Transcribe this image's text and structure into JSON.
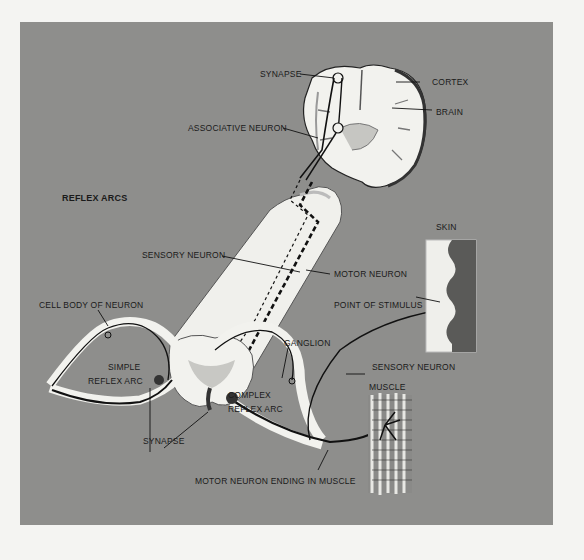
{
  "title": "REFLEX ARCS",
  "labels": {
    "synapse_top": "SYNAPSE",
    "cortex": "CORTEX",
    "brain": "BRAIN",
    "associative_neuron": "ASSOCIATIVE NEURON",
    "sensory_neuron_cord": "SENSORY NEURON",
    "motor_neuron": "MOTOR NEURON",
    "skin": "SKIN",
    "point_of_stimulus": "POINT OF STIMULUS",
    "cell_body_of_neuron": "CELL BODY OF NEURON",
    "ganglion": "GANGLION",
    "sensory_neuron_skin": "SENSORY NEURON",
    "simple_reflex_arc_1": "SIMPLE",
    "simple_reflex_arc_2": "REFLEX ARC",
    "complex_reflex_arc_1": "COMPLEX",
    "complex_reflex_arc_2": "REFLEX ARC",
    "synapse_bottom": "SYNAPSE",
    "muscle": "MUSCLE",
    "motor_neuron_ending": "MOTOR NEURON ENDING IN MUSCLE"
  },
  "colors": {
    "background": "#8e8e8c",
    "page": "#f4f4f2",
    "tissue": "#f2f2ee",
    "gray_matter": "#c8c8c4",
    "nerve": "#111111"
  }
}
